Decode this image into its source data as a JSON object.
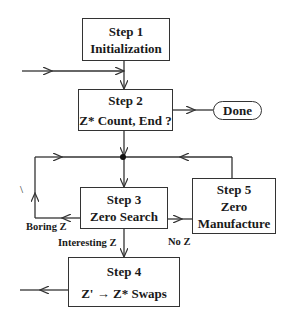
{
  "diagram": {
    "type": "flowchart",
    "nodes": {
      "step1": {
        "title": "Step 1",
        "subtitle": "Initialization"
      },
      "step2": {
        "title": "Step 2",
        "subtitle": "Z* Count, End ?"
      },
      "done": {
        "label": "Done"
      },
      "step3": {
        "title": "Step 3",
        "subtitle": "Zero Search"
      },
      "step4": {
        "title": "Step 4",
        "subtitle_left": "Z'",
        "subtitle_arrow": "→",
        "subtitle_right": "Z* Swaps"
      },
      "step5": {
        "title": "Step 5",
        "line2": "Zero",
        "line3": "Manufacture"
      }
    },
    "edge_labels": {
      "boring": "Boring Z",
      "interesting": "Interesting Z",
      "noz": "No Z"
    },
    "stray_mark": "\\",
    "edges": [
      {
        "from": "external",
        "to": "step2"
      },
      {
        "from": "step1",
        "to": "step2"
      },
      {
        "from": "step2",
        "to": "done"
      },
      {
        "from": "step2",
        "to": "junction"
      },
      {
        "from": "junction",
        "to": "step3"
      },
      {
        "from": "step3",
        "to": "junction",
        "label": "Boring Z"
      },
      {
        "from": "step3",
        "to": "step5",
        "label": "No Z"
      },
      {
        "from": "step5",
        "to": "junction"
      },
      {
        "from": "step3",
        "to": "step4",
        "label": "Interesting Z"
      },
      {
        "from": "step4",
        "to": "external"
      }
    ],
    "colors": {
      "line": "#333333",
      "background": "#ffffff"
    }
  }
}
